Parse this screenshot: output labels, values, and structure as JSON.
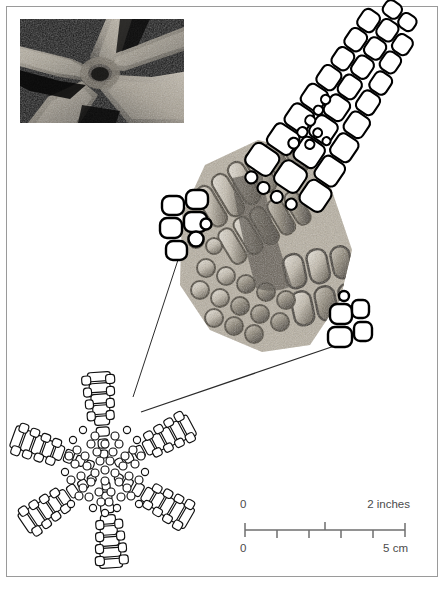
{
  "figure": {
    "frame_color": "#9a9a9a",
    "background_color": "#ffffff",
    "ink_color": "#000000",
    "caption_text": ""
  },
  "photo_inset": {
    "name": "sea-star-surface-photograph",
    "description": "Dark close-up photograph of a live sea star central disc and arm bases",
    "background_color": "#0b0b0b",
    "highlight_color": "#cfc8bb"
  },
  "specimen_photo": {
    "name": "ossicle-plate-photomicrograph",
    "description": "Magnified greyscale photograph of calcite ossicle plates on an arm fragment",
    "tone_light": "#e8e3da",
    "tone_mid": "#a29a8c",
    "tone_dark": "#3b362f"
  },
  "line_drawings": {
    "arm_tip": {
      "name": "arm-tip-ossicle-diagram",
      "description": "Ink line drawing of the tapering arm tip showing marginal and dorsal ossicle rows"
    },
    "left_cluster": {
      "name": "left-ossicle-cluster-diagram",
      "description": "Small ink cluster of ossicle outlines at the left edge of the magnified region"
    },
    "lower_cluster": {
      "name": "lower-ossicle-cluster-diagram",
      "description": "Small ink cluster of ossicle outlines at the lower right of the magnified region"
    }
  },
  "whole_animal": {
    "name": "whole-sea-star-skeleton-diagram",
    "description": "Complete six-rayed sea star skeleton drawn as a mosaic of ossicle plates",
    "arm_count": 6
  },
  "leader_lines": {
    "name": "magnification-leader-lines",
    "count": 2,
    "description": "Two straight rules connecting the whole-animal diagram to the magnified detail"
  },
  "scale_bar": {
    "name": "dual-unit-scale-bar",
    "inches": {
      "left_label": "0",
      "right_label": "2 inches",
      "ticks_above": 1
    },
    "centimeters": {
      "left_label": "0",
      "right_label": "5 cm",
      "ticks_below": 4
    },
    "bar_color": "#6e6e6e",
    "label_color": "#4b4b4b",
    "length_px": 160
  }
}
